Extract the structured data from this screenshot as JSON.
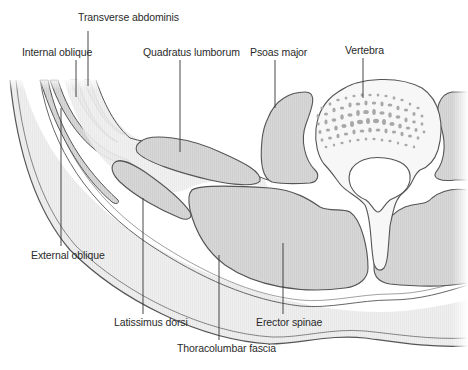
{
  "figure": {
    "colors": {
      "muscle_fill": "#d6d6d6",
      "fascia_fill": "#ededed",
      "bone_fill": "#f7f7f7",
      "trabecula": "#a3a3a3",
      "outline": "#555555",
      "leader": "#333333",
      "text": "#2a2a2a"
    },
    "labels": [
      {
        "id": "transverse-abdominis",
        "text": "Transverse abdominis",
        "x": 78,
        "y": 17
      },
      {
        "id": "internal-oblique",
        "text": "Internal oblique",
        "x": 22,
        "y": 46
      },
      {
        "id": "quadratus-lumborum",
        "text": "Quadratus lumborum",
        "x": 143,
        "y": 46
      },
      {
        "id": "psoas-major",
        "text": "Psoas major",
        "x": 250,
        "y": 46
      },
      {
        "id": "vertebra",
        "text": "Vertebra",
        "x": 345,
        "y": 44
      },
      {
        "id": "external-oblique",
        "text": "External oblique",
        "x": 31,
        "y": 248
      },
      {
        "id": "latissimus-dorsi",
        "text": "Latissimus dorsi",
        "x": 114,
        "y": 316
      },
      {
        "id": "erector-spinae",
        "text": "Erector spinae",
        "x": 256,
        "y": 316
      },
      {
        "id": "thoracolumbar-fascia",
        "text": "Thoracolumbar fascia",
        "x": 177,
        "y: ": 0,
        "y": 342
      }
    ]
  }
}
